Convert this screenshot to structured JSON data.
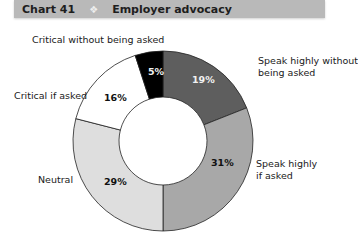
{
  "header": {
    "chart_number": "Chart 41",
    "separator_icon": "diamond-icon",
    "title": "Employer advocacy"
  },
  "labels": {
    "speak_without": "Speak highly without\nbeing asked",
    "speak_without_line1": "Speak highly without",
    "speak_without_line2": "being asked",
    "speak_if_line1": "Speak highly",
    "speak_if_line2": "if asked",
    "neutral": "Neutral",
    "critical_if": "Critical if asked",
    "critical_without": "Critical without being asked"
  },
  "percent_labels": {
    "speak_without": "19%",
    "speak_if": "31%",
    "neutral": "29%",
    "critical_if": "16%",
    "critical_without": "5%"
  },
  "colors": {
    "speak_without": "#5e5e5e",
    "speak_if": "#a8a8a8",
    "neutral": "#dedede",
    "critical_if": "#ffffff",
    "critical_without": "#000000",
    "header_bg": "#b9b9b9"
  },
  "chart_data": {
    "type": "pie",
    "subtype": "donut",
    "categories": [
      "Speak highly without being asked",
      "Speak highly if asked",
      "Neutral",
      "Critical if asked",
      "Critical without being asked"
    ],
    "values": [
      19,
      31,
      29,
      16,
      5
    ],
    "unit": "%",
    "start_angle": "12 o'clock, clockwise",
    "legend": "direct labels outside slices"
  }
}
